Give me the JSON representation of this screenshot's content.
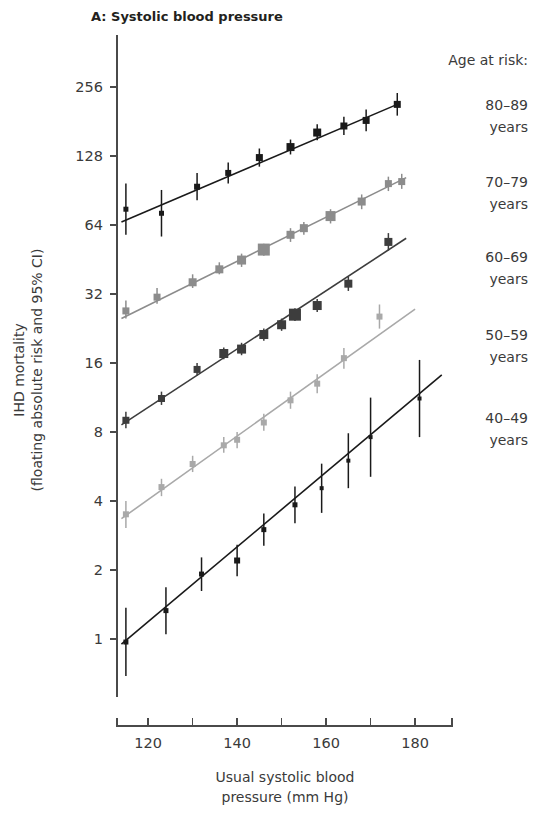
{
  "figure": {
    "panel_title": "A: Systolic blood pressure",
    "background": "#ffffff"
  },
  "y_axis": {
    "title_line1": "IHD mortality",
    "title_line2": "(floating absolute risk and 95% CI)",
    "scale": "log2",
    "ticks": [
      1,
      2,
      4,
      8,
      16,
      32,
      64,
      128,
      256
    ],
    "tick_labels": [
      "1",
      "2",
      "4",
      "8",
      "16",
      "32",
      "64",
      "128",
      "256"
    ],
    "range": [
      0.56,
      430
    ]
  },
  "x_axis": {
    "title_line1": "Usual systolic blood",
    "title_line2": "pressure (mm Hg)",
    "major_ticks": [
      120,
      140,
      160,
      180
    ],
    "major_tick_labels": [
      "120",
      "140",
      "160",
      "180"
    ],
    "minor_ticks": [
      110,
      130,
      150,
      170,
      190
    ],
    "range": [
      113,
      188
    ]
  },
  "legend": {
    "heading": "Age at risk:",
    "entries": [
      {
        "range": "80–89",
        "unit": "years",
        "color": "#1a1a1a"
      },
      {
        "range": "70–79",
        "unit": "years",
        "color": "#8c8c8c"
      },
      {
        "range": "60–69",
        "unit": "years",
        "color": "#3d3d3d"
      },
      {
        "range": "50–59",
        "unit": "years",
        "color": "#a9a9a9"
      },
      {
        "range": "40–49",
        "unit": "years",
        "color": "#1a1a1a"
      }
    ]
  },
  "chart_data": {
    "type": "scatter",
    "title": "A: Systolic blood pressure",
    "xlabel": "Usual systolic blood pressure (mm Hg)",
    "ylabel": "IHD mortality (floating absolute risk and 95% CI)",
    "yscale": "log2",
    "ylim": [
      0.56,
      430
    ],
    "xlim": [
      113,
      188
    ],
    "grid": false,
    "legend_position": "right",
    "series": [
      {
        "name": "80–89 years",
        "color": "#1a1a1a",
        "marker": "square",
        "line": {
          "x_start": 114,
          "y_start": 66,
          "x_end": 176,
          "y_end": 215
        },
        "points": [
          {
            "x": 115,
            "y": 75,
            "ci_low": 58,
            "ci_high": 97,
            "size": 5
          },
          {
            "x": 123,
            "y": 72,
            "ci_low": 57,
            "ci_high": 91,
            "size": 5
          },
          {
            "x": 131,
            "y": 94,
            "ci_low": 82,
            "ci_high": 108,
            "size": 6
          },
          {
            "x": 138,
            "y": 108,
            "ci_low": 97,
            "ci_high": 120,
            "size": 6
          },
          {
            "x": 145,
            "y": 126,
            "ci_low": 115,
            "ci_high": 138,
            "size": 7
          },
          {
            "x": 152,
            "y": 140,
            "ci_low": 130,
            "ci_high": 151,
            "size": 8
          },
          {
            "x": 158,
            "y": 162,
            "ci_low": 150,
            "ci_high": 176,
            "size": 8
          },
          {
            "x": 164,
            "y": 173,
            "ci_low": 158,
            "ci_high": 190,
            "size": 7
          },
          {
            "x": 169,
            "y": 183,
            "ci_low": 164,
            "ci_high": 204,
            "size": 7
          },
          {
            "x": 176,
            "y": 215,
            "ci_low": 192,
            "ci_high": 241,
            "size": 7
          }
        ]
      },
      {
        "name": "70–79 years",
        "color": "#8c8c8c",
        "marker": "square",
        "line": {
          "x_start": 114,
          "y_start": 25,
          "x_end": 178,
          "y_end": 103
        },
        "points": [
          {
            "x": 115,
            "y": 27,
            "ci_low": 25,
            "ci_high": 30,
            "size": 7
          },
          {
            "x": 122,
            "y": 31,
            "ci_low": 29,
            "ci_high": 34,
            "size": 7
          },
          {
            "x": 130,
            "y": 36,
            "ci_low": 34,
            "ci_high": 39,
            "size": 8
          },
          {
            "x": 136,
            "y": 41,
            "ci_low": 39,
            "ci_high": 44,
            "size": 8
          },
          {
            "x": 141,
            "y": 45,
            "ci_low": 42,
            "ci_high": 48,
            "size": 9
          },
          {
            "x": 146,
            "y": 50,
            "ci_low": 47,
            "ci_high": 53,
            "size": 12
          },
          {
            "x": 152,
            "y": 58,
            "ci_low": 54,
            "ci_high": 62,
            "size": 8
          },
          {
            "x": 155,
            "y": 62,
            "ci_low": 58,
            "ci_high": 66,
            "size": 8
          },
          {
            "x": 161,
            "y": 70,
            "ci_low": 65,
            "ci_high": 75,
            "size": 10
          },
          {
            "x": 168,
            "y": 81,
            "ci_low": 75,
            "ci_high": 87,
            "size": 8
          },
          {
            "x": 174,
            "y": 97,
            "ci_low": 90,
            "ci_high": 104,
            "size": 7
          },
          {
            "x": 177,
            "y": 99,
            "ci_low": 92,
            "ci_high": 107,
            "size": 7
          }
        ]
      },
      {
        "name": "60–69 years",
        "color": "#3d3d3d",
        "marker": "square",
        "line": {
          "x_start": 114,
          "y_start": 8.6,
          "x_end": 178,
          "y_end": 56
        },
        "points": [
          {
            "x": 115,
            "y": 9.0,
            "ci_low": 8.3,
            "ci_high": 9.8,
            "size": 7
          },
          {
            "x": 123,
            "y": 11.2,
            "ci_low": 10.5,
            "ci_high": 12.0,
            "size": 7
          },
          {
            "x": 131,
            "y": 15.0,
            "ci_low": 14.1,
            "ci_high": 16.0,
            "size": 7
          },
          {
            "x": 137,
            "y": 17.6,
            "ci_low": 16.6,
            "ci_high": 18.7,
            "size": 9
          },
          {
            "x": 141,
            "y": 18.4,
            "ci_low": 17.3,
            "ci_high": 19.6,
            "size": 9
          },
          {
            "x": 146,
            "y": 21.3,
            "ci_low": 20.0,
            "ci_high": 22.6,
            "size": 9
          },
          {
            "x": 150,
            "y": 23.5,
            "ci_low": 22.1,
            "ci_high": 25.0,
            "size": 9
          },
          {
            "x": 153,
            "y": 26.0,
            "ci_low": 24.4,
            "ci_high": 27.7,
            "size": 12
          },
          {
            "x": 158,
            "y": 28.5,
            "ci_low": 26.7,
            "ci_high": 30.4,
            "size": 9
          },
          {
            "x": 165,
            "y": 35.5,
            "ci_low": 33.0,
            "ci_high": 38.2,
            "size": 8
          },
          {
            "x": 174,
            "y": 54.0,
            "ci_low": 49.5,
            "ci_high": 59.0,
            "size": 8
          }
        ]
      },
      {
        "name": "50–59 years",
        "color": "#a9a9a9",
        "marker": "square",
        "line": {
          "x_start": 114,
          "y_start": 3.35,
          "x_end": 180,
          "y_end": 27.5
        },
        "points": [
          {
            "x": 115,
            "y": 3.5,
            "ci_low": 3.05,
            "ci_high": 4.0,
            "size": 6
          },
          {
            "x": 123,
            "y": 4.6,
            "ci_low": 4.2,
            "ci_high": 5.0,
            "size": 6
          },
          {
            "x": 130,
            "y": 5.8,
            "ci_low": 5.35,
            "ci_high": 6.3,
            "size": 6
          },
          {
            "x": 137,
            "y": 7.0,
            "ci_low": 6.5,
            "ci_high": 7.6,
            "size": 6
          },
          {
            "x": 140,
            "y": 7.4,
            "ci_low": 6.8,
            "ci_high": 8.0,
            "size": 6
          },
          {
            "x": 146,
            "y": 8.8,
            "ci_low": 8.1,
            "ci_high": 9.6,
            "size": 6
          },
          {
            "x": 152,
            "y": 11.0,
            "ci_low": 10.1,
            "ci_high": 12.0,
            "size": 6
          },
          {
            "x": 158,
            "y": 13.0,
            "ci_low": 11.8,
            "ci_high": 14.3,
            "size": 6
          },
          {
            "x": 164,
            "y": 16.8,
            "ci_low": 15.1,
            "ci_high": 18.6,
            "size": 6
          },
          {
            "x": 172,
            "y": 25.5,
            "ci_low": 22.6,
            "ci_high": 28.8,
            "size": 6
          }
        ]
      },
      {
        "name": "40–49 years",
        "color": "#1a1a1a",
        "marker": "square",
        "line": {
          "x_start": 114,
          "y_start": 0.95,
          "x_end": 186,
          "y_end": 14.2
        },
        "points": [
          {
            "x": 115,
            "y": 0.97,
            "ci_low": 0.69,
            "ci_high": 1.37,
            "size": 5
          },
          {
            "x": 124,
            "y": 1.33,
            "ci_low": 1.05,
            "ci_high": 1.68,
            "size": 5
          },
          {
            "x": 132,
            "y": 1.92,
            "ci_low": 1.62,
            "ci_high": 2.27,
            "size": 5
          },
          {
            "x": 140,
            "y": 2.2,
            "ci_low": 1.88,
            "ci_high": 2.58,
            "size": 6
          },
          {
            "x": 146,
            "y": 3.0,
            "ci_low": 2.55,
            "ci_high": 3.53,
            "size": 5
          },
          {
            "x": 153,
            "y": 3.85,
            "ci_low": 3.2,
            "ci_high": 4.63,
            "size": 5
          },
          {
            "x": 159,
            "y": 4.55,
            "ci_low": 3.55,
            "ci_high": 5.82,
            "size": 4
          },
          {
            "x": 165,
            "y": 6.0,
            "ci_low": 4.55,
            "ci_high": 7.9,
            "size": 4
          },
          {
            "x": 170,
            "y": 7.6,
            "ci_low": 5.1,
            "ci_high": 11.3,
            "size": 4
          },
          {
            "x": 181,
            "y": 11.2,
            "ci_low": 7.6,
            "ci_high": 16.5,
            "size": 4
          }
        ]
      }
    ]
  }
}
